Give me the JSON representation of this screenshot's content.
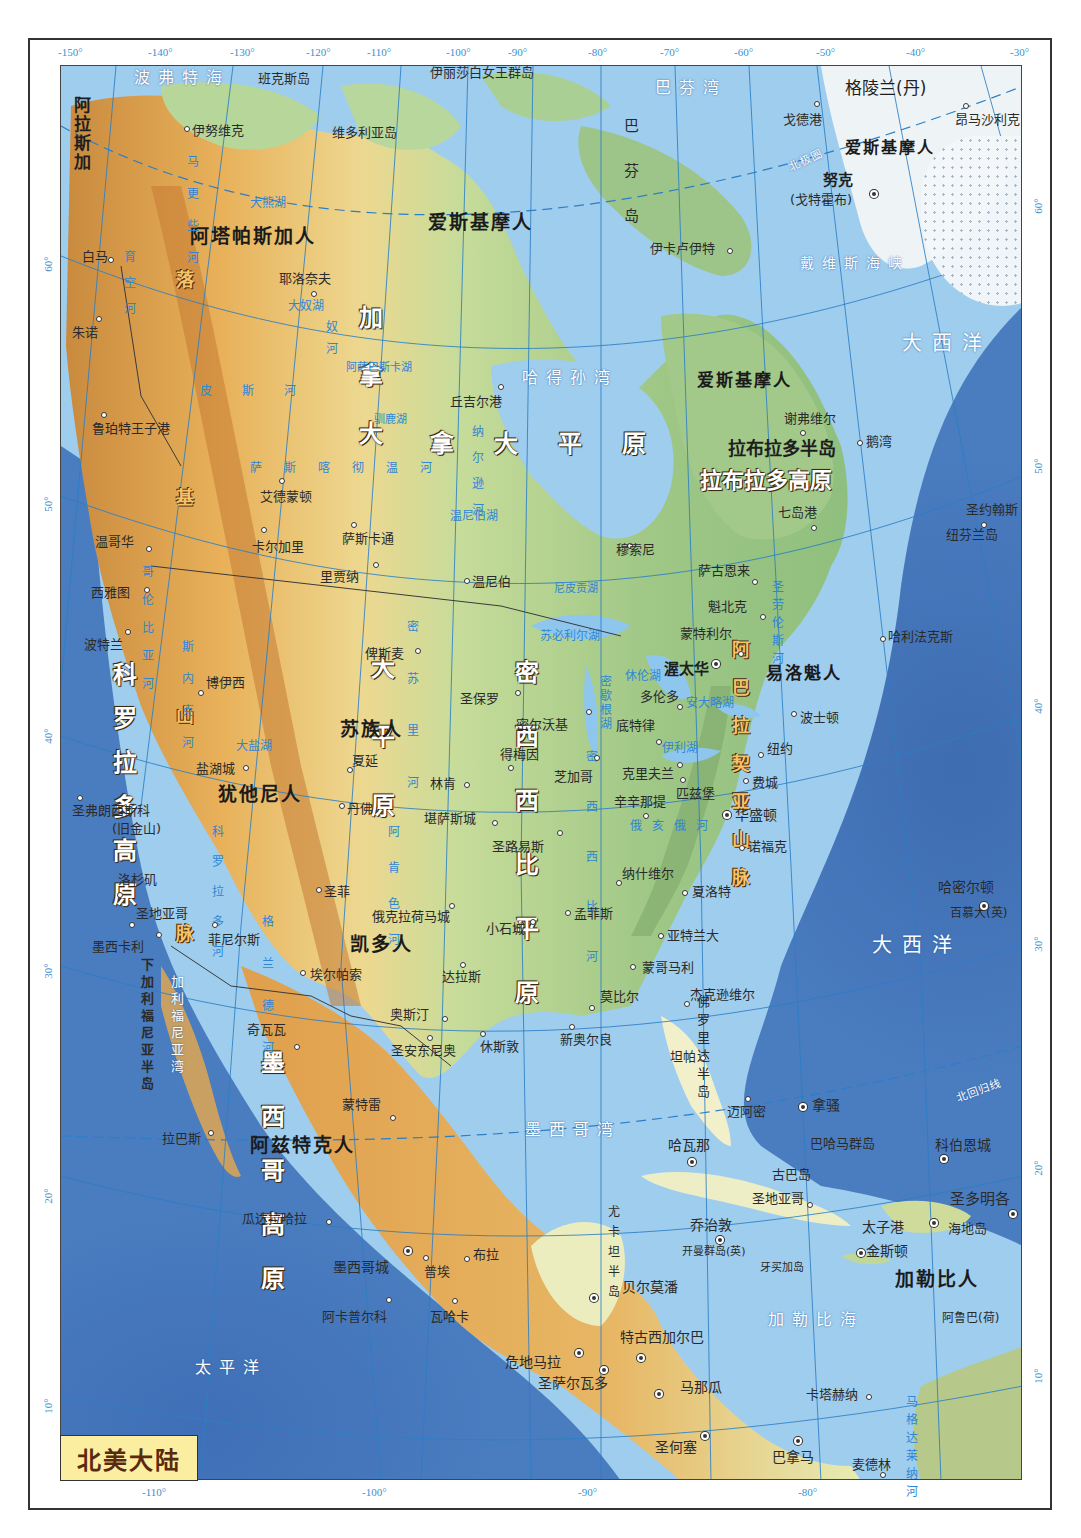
{
  "map": {
    "title": "北美大陆",
    "colors": {
      "ocean_deep": "#3e6cb1",
      "ocean_shelf": "#a9d4f0",
      "lowland": "#8cc07a",
      "plain": "#e9ecb0",
      "plateau": "#e8a94e",
      "mountain": "#c9772f",
      "ice": "#f5f8fb",
      "graticule": "#2c7fc6",
      "title_bg": "#fbeea0"
    },
    "longitude_ticks_top": [
      "-150°",
      "-140°",
      "-130°",
      "-120°",
      "-110°",
      "-100°",
      "-90°",
      "-80°",
      "-70°",
      "-60°",
      "-50°",
      "-40°",
      "-30°"
    ],
    "longitude_ticks_bottom": [
      "-110°",
      "-100°",
      "-90°",
      "-80°"
    ],
    "latitude_ticks_left": [
      "60°",
      "50°",
      "40°",
      "30°",
      "20°",
      "10°"
    ],
    "latitude_ticks_right": [
      "60°",
      "50°",
      "40°",
      "30°",
      "20°",
      "10°"
    ],
    "seas": {
      "beaufort": "波弗特海",
      "baffin_bay": "巴芬湾",
      "hudson_bay": "哈得孙湾",
      "davis_strait": "戴维斯海峡",
      "atlantic_n": "大西洋",
      "atlantic_s": "大西洋",
      "pacific": "太平洋",
      "gulf_mexico": "墨西哥湾",
      "caribbean": "加勒比海",
      "gulf_california": "加利福尼亚湾",
      "arctic_circle": "北极圈",
      "tropic_cancer": "北回归线"
    },
    "islands": {
      "banks": "班克斯岛",
      "queen_elizabeth": "伊丽莎白女王群岛",
      "victoria": "维多利亚岛",
      "greenland": "格陵兰(丹)",
      "baffin": "巴芬岛",
      "newfoundland": "纽芬兰岛",
      "bahamas": "巴哈马群岛",
      "cuba": "古巴岛",
      "hispaniola": "海地岛",
      "jamaica": "牙买加岛",
      "cayman": "开曼群岛(英)",
      "bermuda": "百慕大(英)",
      "aruba": "阿鲁巴(荷)"
    },
    "regions": {
      "alaska": "阿拉斯加",
      "canada": "加拿大",
      "rocky_mountains": "落基山脉",
      "cordillera": "科罗拉多高原",
      "great_plains": "大平原",
      "canada_plain": "拿大平原",
      "central_plains": "密西西比平原",
      "appalachian": "阿巴拉契亚山脉",
      "labrador_peninsula": "拉布拉多半岛",
      "labrador_plateau": "拉布拉多高原",
      "mexican_plateau": "墨西哥高原",
      "baja": "下加利福尼亚半岛",
      "florida": "佛罗里达半岛",
      "yucatan": "尤卡坦半岛"
    },
    "peoples": {
      "athabaskan": "阿塔帕斯加人",
      "eskimo_n": "爱斯基摩人",
      "eskimo_greenland": "爱斯基摩人",
      "eskimo_labrador": "爱斯基摩人",
      "sioux": "苏族人",
      "ute": "犹他尼人",
      "caddo": "凯多人",
      "iroquois": "易洛魁人",
      "aztec": "阿兹特克人",
      "carib": "加勒比人"
    },
    "lakes": {
      "great_bear": "大熊湖",
      "great_slave": "大奴湖",
      "athabasca": "阿萨巴斯卡湖",
      "reindeer": "驯鹿湖",
      "winnipeg": "温尼伯湖",
      "nipigon": "尼皮贡湖",
      "superior": "苏必利尔湖",
      "michigan": "密歇根湖",
      "huron": "休伦湖",
      "erie": "伊利湖",
      "ontario": "安大略湖",
      "great_salt": "大盐湖"
    },
    "rivers": {
      "yukon": "育空河",
      "mackenzie": "马更些河",
      "slave": "奴河",
      "peace": "皮斯河",
      "saskatchewan": "萨斯喀彻温河",
      "nelson": "纳尔逊河",
      "columbia": "哥伦比亚河",
      "snake": "斯内克河",
      "missouri": "密苏里河",
      "mississippi": "密西西比河",
      "ohio": "俄亥俄河",
      "arkansas": "阿肯色河",
      "colorado": "科罗拉多河",
      "rio_grande": "格兰德河",
      "st_lawrence": "圣劳伦斯河",
      "magdalena": "马格达莱纳河"
    },
    "cities": {
      "inuvik": "伊努维克",
      "whitehorse": "白马",
      "juneau": "朱诺",
      "prince_rupert": "鲁珀特王子港",
      "yellowknife": "耶洛奈夫",
      "churchill": "丘吉尔港",
      "edmonton": "艾德蒙顿",
      "calgary": "卡尔加里",
      "saskatoon": "萨斯卡通",
      "regina": "里贾纳",
      "winnipeg": "温尼伯",
      "vancouver": "温哥华",
      "seattle": "西雅图",
      "portland": "波特兰",
      "boise": "博伊西",
      "salt_lake": "盐湖城",
      "san_francisco": "圣弗朗西斯科",
      "san_francisco_alt": "(旧金山)",
      "los_angeles": "洛杉矶",
      "san_diego": "圣地亚哥",
      "mexicali": "墨西卡利",
      "phoenix": "菲尼尔斯",
      "santa_fe": "圣菲",
      "el_paso": "埃尔帕索",
      "denver": "丹佛",
      "cheyenne": "夏延",
      "bismarck": "俾斯麦",
      "st_paul": "圣保罗",
      "des_moines": "得梅因",
      "lincoln": "林肯",
      "kansas_city": "堪萨斯城",
      "oklahoma_city": "俄克拉荷马城",
      "dallas": "达拉斯",
      "austin": "奥斯汀",
      "san_antonio": "圣安东尼奥",
      "houston": "休斯敦",
      "new_orleans": "新奥尔良",
      "little_rock": "小石城",
      "memphis": "孟菲斯",
      "st_louis": "圣路易斯",
      "milwaukee": "密尔沃基",
      "chicago": "芝加哥",
      "detroit": "底特律",
      "cleveland": "克里夫兰",
      "cincinnati": "辛辛那提",
      "nashville": "纳什维尔",
      "atlanta": "亚特兰大",
      "montgomery": "蒙哥马利",
      "mobile": "莫比尔",
      "jacksonville": "杰克逊维尔",
      "tampa": "坦帕",
      "miami": "迈阿密",
      "charlotte": "夏洛特",
      "norfolk": "诺福克",
      "washington": "华盛顿",
      "pittsburgh": "匹兹堡",
      "philadelphia": "费城",
      "new_york": "纽约",
      "boston": "波士顿",
      "toronto": "多伦多",
      "ottawa": "渥太华",
      "montreal": "蒙特利尔",
      "quebec": "魁北克",
      "saguenay": "萨古恩来",
      "sept_iles": "七岛港",
      "schefferville": "谢弗维尔",
      "goose_bay": "鹅湾",
      "st_johns": "圣约翰斯",
      "halifax": "哈利法克斯",
      "moosonee": "穆索尼",
      "iqaluit": "伊卡卢伊特",
      "godthab_label": "努克",
      "godthab_alt": "(戈特霍布)",
      "thule": "戈德港",
      "ammassalik": "昂马沙利克",
      "hamilton": "哈密尔顿",
      "nassau": "拿骚",
      "havana": "哈瓦那",
      "santiago": "圣地亚哥",
      "cockburn": "科伯恩城",
      "santo_domingo": "圣多明各",
      "port_au_prince": "太子港",
      "kingston": "金斯顿",
      "george_town": "乔治敦",
      "belmopan": "贝尔莫潘",
      "guatemala": "危地马拉",
      "san_salvador": "圣萨尔瓦多",
      "tegucigalpa": "特古西加尔巴",
      "managua": "马那瓜",
      "san_jose": "圣何塞",
      "panama": "巴拿马",
      "cartagena": "卡塔赫纳",
      "medellin": "麦德林",
      "chihuahua": "奇瓦瓦",
      "monterrey": "蒙特雷",
      "la_paz": "拉巴斯",
      "guadalajara": "瓜达拉哈拉",
      "mexico_city": "墨西哥城",
      "puebla": "普埃",
      "veracruz": "布拉",
      "acapulco": "阿卡普尔科",
      "oaxaca": "瓦哈卡"
    }
  }
}
